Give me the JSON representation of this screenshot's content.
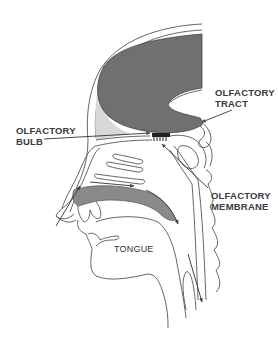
{
  "diagram": {
    "labels": {
      "olfactory_tract": "OLFACTORY\nTRACT",
      "olfactory_bulb": "OLFACTORY\nBULB",
      "olfactory_membrane": "OLFACTORY\nMEMBRANE",
      "tongue": "TONGUE"
    },
    "colors": {
      "brain_fill": "#707070",
      "palate_fill": "#8a8a8a",
      "bone_band": "#d8d8d8",
      "line": "#444444",
      "background": "#ffffff"
    }
  }
}
